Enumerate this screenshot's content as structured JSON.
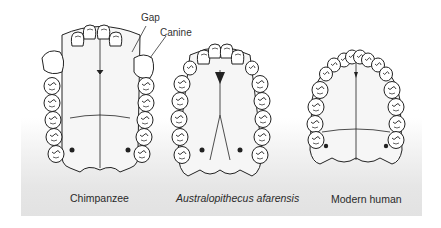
{
  "figure": {
    "callouts": [
      {
        "id": "gap",
        "text": "Gap"
      },
      {
        "id": "canine",
        "text": "Canine"
      }
    ],
    "specimens": [
      {
        "id": "chimpanzee",
        "label": "Chimpanzee",
        "italic": false,
        "arcade_shape": "U-shaped, parallel tooth rows, large canines with diastema"
      },
      {
        "id": "australopithecus",
        "label": "Australopithecus afarensis",
        "italic": true,
        "arcade_shape": "intermediate, slightly divergent tooth rows"
      },
      {
        "id": "human",
        "label": "Modern human",
        "italic": false,
        "arcade_shape": "parabolic, small canines, no gap"
      }
    ],
    "colors": {
      "line": "#222222",
      "tooth_fill": "#ffffff",
      "palate_fill": "#f4f4f4",
      "panel_bottom": "#e2e2e2"
    }
  }
}
